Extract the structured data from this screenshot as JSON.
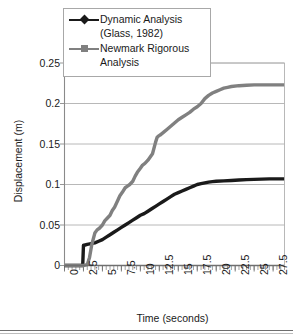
{
  "chart_data": {
    "type": "line",
    "title": "",
    "xlabel": "Time (seconds)",
    "ylabel": "Displacement (m)",
    "xlim": [
      0,
      29
    ],
    "ylim": [
      0,
      0.25
    ],
    "xticks": [
      "0",
      "2.5",
      "5",
      "7.5",
      "10",
      "12.5",
      "15",
      "17.5",
      "20",
      "22.5",
      "25",
      "27.5"
    ],
    "xtick_values": [
      0,
      2.5,
      5,
      7.5,
      10,
      12.5,
      15,
      17.5,
      20,
      22.5,
      25,
      27.5
    ],
    "yticks": [
      "0",
      "0.05",
      "0.1",
      "0.15",
      "0.2",
      "0.25"
    ],
    "ytick_values": [
      0,
      0.05,
      0.1,
      0.15,
      0.2,
      0.25
    ],
    "grid": "horizontal",
    "legend_position": "top-left-inside",
    "series": [
      {
        "name": "Dynamic Analysis (Glass, 1982)",
        "color": "#1a1a1a",
        "marker": "diamond",
        "x": [
          0,
          0.5,
          1.0,
          1.5,
          2.0,
          2.4,
          2.5,
          2.6,
          3.0,
          3.5,
          4.0,
          4.5,
          5.0,
          5.5,
          6.0,
          6.5,
          7.0,
          7.5,
          8.0,
          8.5,
          9.0,
          9.5,
          10.0,
          10.5,
          11.0,
          11.5,
          12.0,
          12.5,
          13.0,
          13.5,
          14.0,
          14.5,
          15.0,
          15.5,
          16.0,
          16.5,
          17.0,
          17.5,
          18.0,
          18.5,
          19.0,
          19.5,
          20.0,
          21.0,
          22.0,
          23.0,
          24.0,
          25.0,
          26.0,
          27.0,
          28.0,
          29.0
        ],
        "y": [
          0,
          0,
          0,
          0,
          0,
          0,
          0.025,
          0.025,
          0.026,
          0.027,
          0.028,
          0.03,
          0.032,
          0.035,
          0.038,
          0.041,
          0.044,
          0.047,
          0.05,
          0.053,
          0.056,
          0.059,
          0.062,
          0.064,
          0.067,
          0.07,
          0.073,
          0.076,
          0.079,
          0.082,
          0.085,
          0.088,
          0.09,
          0.092,
          0.094,
          0.096,
          0.098,
          0.1,
          0.101,
          0.102,
          0.103,
          0.1035,
          0.104,
          0.1045,
          0.105,
          0.1055,
          0.106,
          0.1063,
          0.1066,
          0.107,
          0.107,
          0.107
        ]
      },
      {
        "name": "Newmark Rigorous Analysis",
        "color": "#808080",
        "marker": "square",
        "x": [
          0,
          0.5,
          1.0,
          1.5,
          2.0,
          2.5,
          3.0,
          3.3,
          3.6,
          4.0,
          4.3,
          4.6,
          5.0,
          5.3,
          5.6,
          6.0,
          6.3,
          6.6,
          7.0,
          7.3,
          7.6,
          8.0,
          8.3,
          8.6,
          9.0,
          9.3,
          9.6,
          10.0,
          10.3,
          10.6,
          11.0,
          11.3,
          11.6,
          12.0,
          12.2,
          12.4,
          12.6,
          13.0,
          13.5,
          14.0,
          14.5,
          15.0,
          15.5,
          16.0,
          16.5,
          17.0,
          17.5,
          18.0,
          18.5,
          19.0,
          19.5,
          20.0,
          20.5,
          21.0,
          21.5,
          22.0,
          23.0,
          24.0,
          25.0,
          26.0,
          27.0,
          28.0,
          29.0
        ],
        "y": [
          0,
          0,
          0,
          0,
          0,
          0,
          0.001,
          0.01,
          0.026,
          0.04,
          0.044,
          0.046,
          0.05,
          0.055,
          0.058,
          0.062,
          0.068,
          0.072,
          0.08,
          0.086,
          0.09,
          0.096,
          0.098,
          0.1,
          0.104,
          0.11,
          0.115,
          0.12,
          0.124,
          0.126,
          0.13,
          0.134,
          0.138,
          0.152,
          0.158,
          0.16,
          0.161,
          0.164,
          0.168,
          0.172,
          0.176,
          0.18,
          0.183,
          0.186,
          0.189,
          0.193,
          0.196,
          0.2,
          0.206,
          0.21,
          0.213,
          0.215,
          0.217,
          0.219,
          0.22,
          0.221,
          0.222,
          0.2225,
          0.223,
          0.223,
          0.223,
          0.223,
          0.223
        ]
      }
    ],
    "annotations": {
      "dynamic_step_time": 2.5,
      "dynamic_step_value": 0.025,
      "dynamic_plateau": 0.107,
      "newmark_plateau": 0.223
    }
  },
  "legend": {
    "entries": [
      {
        "label_line1": "Dynamic Analysis",
        "label_line2": "(Glass, 1982)",
        "color": "#1a1a1a",
        "marker": "diamond"
      },
      {
        "label_line1": "Newmark Rigorous",
        "label_line2": "Analysis",
        "color": "#808080",
        "marker": "square"
      }
    ]
  },
  "colors": {
    "dynamic": "#1a1a1a",
    "newmark": "#808080",
    "grid": "#b0b0b0",
    "axis": "#8a8a8a",
    "text": "#1a1a1a"
  }
}
